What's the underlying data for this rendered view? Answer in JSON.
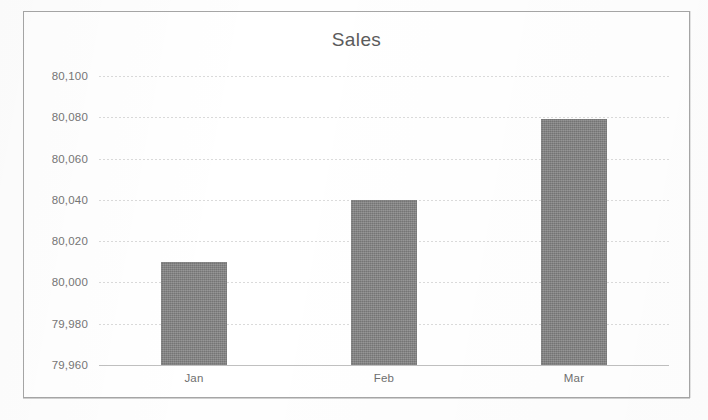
{
  "chart_data": {
    "type": "bar",
    "title": "Sales",
    "categories": [
      "Jan",
      "Feb",
      "Mar"
    ],
    "values": [
      80010,
      80040,
      80079
    ],
    "series": [
      {
        "name": "Sales",
        "values": [
          80010,
          80040,
          80079
        ]
      }
    ],
    "xlabel": "",
    "ylabel": "",
    "ylim": [
      79960,
      80100
    ],
    "ytick_step": 20,
    "ytick_labels": [
      "80,100",
      "80,080",
      "80,060",
      "80,040",
      "80,020",
      "80,000",
      "79,980",
      "79,960"
    ],
    "ytick_values": [
      80100,
      80080,
      80060,
      80040,
      80020,
      80000,
      79980,
      79960
    ],
    "grid": true,
    "grid_axis": "y",
    "legend": false,
    "legend_position": "none",
    "bar_color": "#808080",
    "grid_color": "#d9d9d9",
    "text_color": "#6f6f6f",
    "title_color": "#5b5b5b",
    "plot_background": "#ffffff",
    "chart_border_color": "#a6a6a6"
  }
}
